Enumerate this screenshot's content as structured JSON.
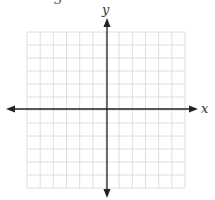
{
  "header": {
    "fragment_text": "3"
  },
  "axes": {
    "x_label": "x",
    "y_label": "y"
  },
  "grid": {
    "columns": 12,
    "rows": 12,
    "left": 27,
    "top": 32,
    "right": 185,
    "bottom": 188,
    "line_color": "#d6d6d6"
  },
  "origin": {
    "x": 107,
    "y": 109
  },
  "colors": {
    "axis": "#222222",
    "grid": "#d6d6d6"
  }
}
